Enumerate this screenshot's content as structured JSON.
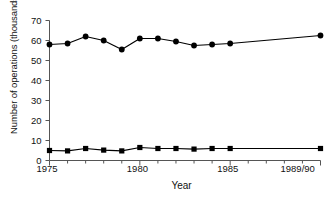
{
  "chart_data": {
    "type": "line",
    "title": "",
    "xlabel": "Year",
    "ylabel": "Number of operations (thousands)",
    "x": [
      1975,
      1976,
      1977,
      1978,
      1979,
      1980,
      1981,
      1982,
      1983,
      1984,
      1985,
      1990
    ],
    "x_tick_values": [
      1975,
      1980,
      1985,
      1990
    ],
    "x_tick_labels": [
      "1975",
      "1980",
      "1985",
      "1989/90"
    ],
    "xlim": [
      1975,
      1990
    ],
    "y_tick_labels": [
      "0",
      "10",
      "20",
      "30",
      "40",
      "50",
      "60",
      "70"
    ],
    "y_tick_values": [
      0,
      10,
      20,
      30,
      40,
      50,
      60,
      70
    ],
    "ylim": [
      0,
      70
    ],
    "grid": false,
    "legend": "none",
    "series": [
      {
        "name": "upper-series",
        "marker": "circle",
        "color": "#000000",
        "values": [
          58.0,
          58.5,
          62.0,
          60.0,
          55.5,
          61.0,
          61.0,
          59.5,
          57.5,
          58.0,
          58.5,
          62.5
        ]
      },
      {
        "name": "lower-series",
        "marker": "square",
        "color": "#000000",
        "values": [
          5.0,
          4.8,
          6.0,
          5.2,
          4.8,
          6.5,
          6.0,
          6.0,
          5.7,
          6.0,
          6.0,
          6.0
        ]
      }
    ]
  },
  "axis": {
    "y_title": "Number of operations (thousands)",
    "x_title": "Year"
  }
}
